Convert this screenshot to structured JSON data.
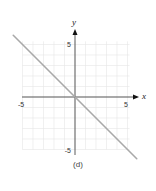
{
  "chart_data": {
    "type": "line",
    "title": "",
    "caption": "(d)",
    "xlabel": "x",
    "ylabel": "y",
    "xlim": [
      -5,
      5
    ],
    "ylim": [
      -5,
      5
    ],
    "x_ticks_labeled": [
      -5,
      5
    ],
    "y_ticks_labeled": [
      5,
      -5
    ],
    "x_tick_labels": [
      "-5",
      "5"
    ],
    "y_tick_labels": [
      "5",
      "-5"
    ],
    "grid": true,
    "grid_step": 1,
    "series": [
      {
        "name": "y = -x",
        "x": [
          -6,
          0,
          6
        ],
        "y": [
          6,
          0,
          -6
        ],
        "color": "#a9a9a9"
      }
    ],
    "colors": {
      "line": "#a9a9a9",
      "grid": "#e6e6e6",
      "axis": "#333333"
    }
  }
}
